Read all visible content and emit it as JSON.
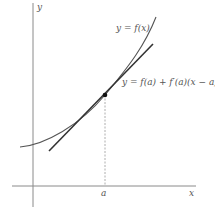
{
  "diagram": {
    "type": "tangent-line-approximation",
    "axes": {
      "x_label": "x",
      "y_label": "y",
      "x_marker": "a"
    },
    "curve": {
      "label": "y = f(x)"
    },
    "tangent": {
      "label": "y = f(a) + f′(a)(x − a)"
    },
    "caption": ""
  },
  "colors": {
    "axis": "#8a8a8a",
    "curve": "#555555",
    "tangent": "#333333",
    "point": "#111111",
    "dashed": "#999999",
    "text": "#555555"
  }
}
